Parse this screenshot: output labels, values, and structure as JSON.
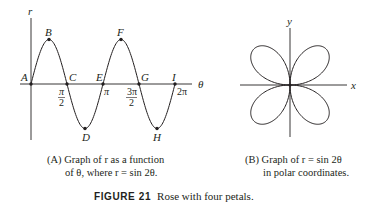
{
  "chart_data": [
    {
      "type": "line",
      "title": "(A) Graph of r as a function of θ, where r = sin 2θ",
      "xlabel": "θ",
      "ylabel": "r",
      "function": "r = sin 2θ",
      "x_ticks": [
        "π/2",
        "π",
        "3π/2",
        "2π"
      ],
      "xlim": [
        0,
        6.283
      ],
      "ylim": [
        -1,
        1
      ],
      "points": [
        {
          "label": "A",
          "theta": 0,
          "r": 0
        },
        {
          "label": "B",
          "theta": 0.785,
          "r": 1
        },
        {
          "label": "C",
          "theta": 1.571,
          "r": 0
        },
        {
          "label": "D",
          "theta": 2.356,
          "r": -1
        },
        {
          "label": "E",
          "theta": 3.142,
          "r": 0
        },
        {
          "label": "F",
          "theta": 3.927,
          "r": 1
        },
        {
          "label": "G",
          "theta": 4.712,
          "r": 0
        },
        {
          "label": "H",
          "theta": 5.498,
          "r": -1
        },
        {
          "label": "I",
          "theta": 6.283,
          "r": 0
        }
      ]
    },
    {
      "type": "line",
      "title": "(B) Graph of r = sin 2θ in polar coordinates",
      "xlabel": "x",
      "ylabel": "y",
      "function": "r = sin 2θ (polar)",
      "description": "Four-petal rose centered at origin, petals in each quadrant"
    }
  ],
  "left": {
    "axis_r": "r",
    "axis_theta": "θ",
    "point_labels": [
      "A",
      "B",
      "C",
      "D",
      "E",
      "F",
      "G",
      "H",
      "I"
    ],
    "ticks": {
      "pi_half_num": "π",
      "pi_half_den": "2",
      "pi": "π",
      "three_pi_half_num": "3π",
      "three_pi_half_den": "2",
      "two_pi": "2π"
    },
    "caption_line1": "(A) Graph of r as a function",
    "caption_line2": "of θ, where r = sin 2θ."
  },
  "right": {
    "axis_x": "x",
    "axis_y": "y",
    "caption_line1": "(B) Graph of r = sin 2θ",
    "caption_line2": "in polar coordinates."
  },
  "figure": {
    "number": "FIGURE 21",
    "caption": "Rose with four petals."
  }
}
